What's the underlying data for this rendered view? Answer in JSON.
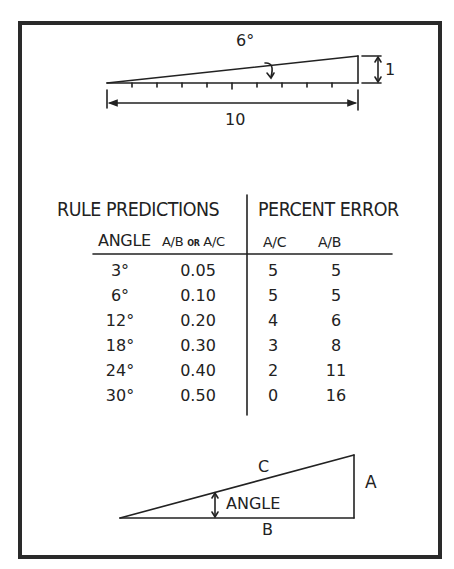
{
  "top_figure": {
    "angle_label": "6°",
    "height_label": "1",
    "length_label": "10"
  },
  "table": {
    "group_headers": [
      "RULE PREDICTIONS",
      "PERCENT ERROR"
    ],
    "sub_headers": {
      "angle": "ANGLE",
      "ratio_a": "A/B",
      "ratio_or": "OR",
      "ratio_b": "A/C",
      "err_ac": "A/C",
      "err_ab": "A/B"
    },
    "rows": [
      {
        "angle": "3°",
        "ratio": "0.05",
        "err_ac": "5",
        "err_ab": "5"
      },
      {
        "angle": "6°",
        "ratio": "0.10",
        "err_ac": "5",
        "err_ab": "5"
      },
      {
        "angle": "12°",
        "ratio": "0.20",
        "err_ac": "4",
        "err_ab": "6"
      },
      {
        "angle": "18°",
        "ratio": "0.30",
        "err_ac": "3",
        "err_ab": "8"
      },
      {
        "angle": "24°",
        "ratio": "0.40",
        "err_ac": "2",
        "err_ab": "11"
      },
      {
        "angle": "30°",
        "ratio": "0.50",
        "err_ac": "0",
        "err_ab": "16"
      }
    ]
  },
  "bottom_figure": {
    "hypotenuse_label": "C",
    "opposite_label": "A",
    "adjacent_label": "B",
    "angle_label": "ANGLE"
  }
}
